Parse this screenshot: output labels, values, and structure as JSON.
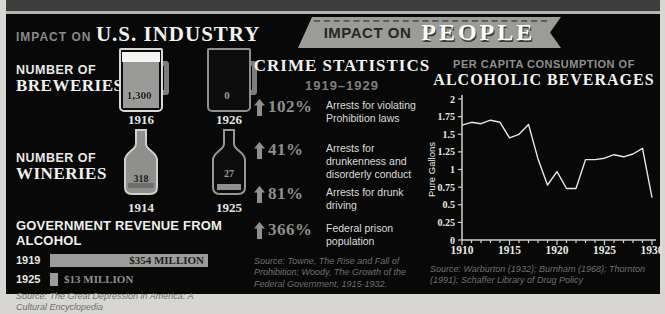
{
  "left": {
    "title_prefix": "IMPACT ON",
    "title": "U.S. INDUSTRY",
    "breweries": {
      "label1": "NUMBER OF",
      "label2": "BREWERIES",
      "items": [
        {
          "value": "1,300",
          "year": "1916"
        },
        {
          "value": "0",
          "year": "1926"
        }
      ]
    },
    "wineries": {
      "label1": "NUMBER OF",
      "label2": "WINERIES",
      "items": [
        {
          "value": "318",
          "year": "1914"
        },
        {
          "value": "27",
          "year": "1925"
        }
      ]
    },
    "revenue": {
      "title": "GOVERNMENT REVENUE FROM ALCOHOL",
      "rows": [
        {
          "year": "1919",
          "amount": "$354 MILLION",
          "bar_px": 158
        },
        {
          "year": "1925",
          "amount": "$13 MILLION",
          "bar_px": 8
        }
      ],
      "source": "Source: The Great Depression in America: A Cultural Encyclopedia"
    }
  },
  "banner": {
    "prefix": "IMPACT ON",
    "title": "PEOPLE"
  },
  "middle": {
    "title": "CRIME STATISTICS",
    "subtitle": "1919–1929",
    "stats": [
      {
        "pct": "102%",
        "desc": "Arrests for violating Prohibition laws"
      },
      {
        "pct": "41%",
        "desc": "Arrests for drunkenness and disorderly conduct"
      },
      {
        "pct": "81%",
        "desc": "Arrests for drunk driving"
      },
      {
        "pct": "366%",
        "desc": "Federal prison population"
      }
    ],
    "source": "Source: Towne, The Rise and Fall of Prohibition; Woody, The Growth of the Federal Government, 1915-1932."
  },
  "right": {
    "title_prefix": "PER CAPITA CONSUMPTION OF",
    "title": "ALCOHOLIC BEVERAGES",
    "source": "Source: Warburton (1932); Burnham (1968); Thornton (1991); Schaffer Library of Drug Policy"
  },
  "colors": {
    "panel_bg": "#080808",
    "page_bg": "#d7d6d2",
    "accent_gray": "#9b9b97",
    "text_white": "#f0f0ee",
    "text_gray": "#8f8f8d",
    "chart_line": "#e8e8e6"
  },
  "chart_data": [
    {
      "type": "bar",
      "title": "NUMBER OF BREWERIES",
      "categories": [
        "1916",
        "1926"
      ],
      "values": [
        1300,
        0
      ]
    },
    {
      "type": "bar",
      "title": "NUMBER OF WINERIES",
      "categories": [
        "1914",
        "1925"
      ],
      "values": [
        318,
        27
      ]
    },
    {
      "type": "bar",
      "title": "GOVERNMENT REVENUE FROM ALCOHOL",
      "categories": [
        "1919",
        "1925"
      ],
      "values": [
        354,
        13
      ],
      "unit": "million USD"
    },
    {
      "type": "line",
      "title": "PER CAPITA CONSUMPTION OF ALCOHOLIC BEVERAGES",
      "xlabel": "",
      "ylabel": "Pure Gallons",
      "ylim": [
        0,
        2
      ],
      "ytick_step": 0.25,
      "xticks": [
        1910,
        1915,
        1920,
        1925,
        1930
      ],
      "x": [
        1910,
        1911,
        1912,
        1913,
        1914,
        1915,
        1916,
        1917,
        1918,
        1919,
        1920,
        1921,
        1922,
        1923,
        1924,
        1925,
        1926,
        1927,
        1928,
        1929,
        1930
      ],
      "values": [
        1.63,
        1.67,
        1.65,
        1.7,
        1.67,
        1.45,
        1.5,
        1.64,
        1.15,
        0.78,
        0.97,
        0.73,
        0.73,
        1.14,
        1.14,
        1.16,
        1.21,
        1.18,
        1.22,
        1.3,
        0.6
      ],
      "grid": false,
      "legend": "none"
    }
  ]
}
